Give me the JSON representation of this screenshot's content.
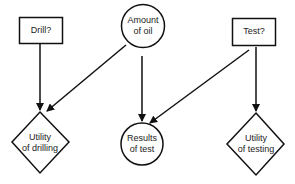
{
  "diagram": {
    "type": "influence-diagram",
    "nodes": [
      {
        "id": "drill",
        "shape": "rectangle",
        "kind": "decision",
        "lines": [
          "Drill?"
        ]
      },
      {
        "id": "oil",
        "shape": "circle",
        "kind": "chance",
        "lines": [
          "Amount",
          "of oil"
        ]
      },
      {
        "id": "test",
        "shape": "rectangle",
        "kind": "decision",
        "lines": [
          "Test?"
        ]
      },
      {
        "id": "util_drill",
        "shape": "diamond",
        "kind": "value",
        "lines": [
          "Utility",
          "of drilling"
        ]
      },
      {
        "id": "results",
        "shape": "circle",
        "kind": "chance",
        "lines": [
          "Results",
          "of test"
        ]
      },
      {
        "id": "util_test",
        "shape": "diamond",
        "kind": "value",
        "lines": [
          "Utility",
          "of testing"
        ]
      }
    ],
    "edges": [
      {
        "from": "drill",
        "to": "util_drill"
      },
      {
        "from": "oil",
        "to": "util_drill"
      },
      {
        "from": "oil",
        "to": "results"
      },
      {
        "from": "test",
        "to": "results"
      },
      {
        "from": "test",
        "to": "util_test"
      }
    ],
    "colors": {
      "stroke": "#111111",
      "background": "#ffffff",
      "text": "#222222"
    }
  }
}
